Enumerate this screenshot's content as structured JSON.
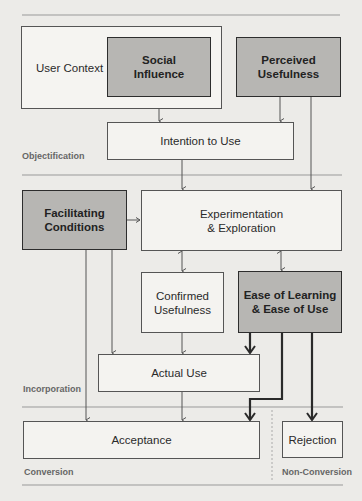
{
  "diagram": {
    "type": "flow-diagram",
    "phases": [
      {
        "id": "objectification",
        "label": "Objectification"
      },
      {
        "id": "incorporation",
        "label": "Incorporation"
      },
      {
        "id": "conversion",
        "label": "Conversion"
      },
      {
        "id": "non_conversion",
        "label": "Non-Conversion"
      }
    ],
    "nodes": {
      "user_context": {
        "label": "User Context",
        "style": "container"
      },
      "social_influence": {
        "label_line1": "Social",
        "label_line2": "Influence",
        "style": "highlighted"
      },
      "perceived_usefulness": {
        "label_line1": "Perceived",
        "label_line2": "Usefulness",
        "style": "highlighted"
      },
      "intention_to_use": {
        "label": "Intention to Use",
        "style": "plain"
      },
      "facilitating_conditions": {
        "label_line1": "Facilitating",
        "label_line2": "Conditions",
        "style": "highlighted"
      },
      "experimentation": {
        "label_line1": "Experimentation",
        "label_line2": "& Exploration",
        "style": "plain"
      },
      "confirmed_usefulness": {
        "label_line1": "Confirmed",
        "label_line2": "Usefulness",
        "style": "plain"
      },
      "ease_of_learning": {
        "label_line1": "Ease of Learning",
        "label_line2": "& Ease of Use",
        "style": "highlighted"
      },
      "actual_use": {
        "label": "Actual Use",
        "style": "plain"
      },
      "acceptance": {
        "label": "Acceptance",
        "style": "plain"
      },
      "rejection": {
        "label": "Rejection",
        "style": "plain"
      }
    },
    "edges": [
      {
        "from": "Social Influence",
        "to": "Intention to Use",
        "weight": "thin"
      },
      {
        "from": "Perceived Usefulness",
        "to": "Intention to Use",
        "weight": "thin"
      },
      {
        "from": "Perceived Usefulness",
        "to": "Experimentation & Exploration",
        "weight": "thin"
      },
      {
        "from": "Intention to Use",
        "to": "Experimentation & Exploration",
        "weight": "thin"
      },
      {
        "from": "Facilitating Conditions",
        "to": "Experimentation & Exploration",
        "weight": "thin"
      },
      {
        "from": "Experimentation & Exploration",
        "to": "Confirmed Usefulness",
        "weight": "thin",
        "bidirectional": true
      },
      {
        "from": "Experimentation & Exploration",
        "to": "Ease of Learning & Ease of Use",
        "weight": "thin",
        "bidirectional": true
      },
      {
        "from": "Facilitating Conditions",
        "to": "Actual Use",
        "weight": "thin"
      },
      {
        "from": "Facilitating Conditions",
        "to": "Acceptance",
        "weight": "thin"
      },
      {
        "from": "Confirmed Usefulness",
        "to": "Actual Use",
        "weight": "thin"
      },
      {
        "from": "Ease of Learning & Ease of Use",
        "to": "Actual Use",
        "weight": "thick"
      },
      {
        "from": "Ease of Learning & Ease of Use",
        "to": "Acceptance",
        "weight": "thick"
      },
      {
        "from": "Ease of Learning & Ease of Use",
        "to": "Rejection",
        "weight": "thick"
      },
      {
        "from": "Actual Use",
        "to": "Acceptance",
        "weight": "thin"
      }
    ],
    "colors": {
      "background": "#ecebe8",
      "highlight_fill": "#b7b6b3",
      "plain_fill": "#f4f3f0",
      "line": "#555555",
      "thick_line": "#2a2a2a",
      "phase_label": "#666666"
    }
  }
}
